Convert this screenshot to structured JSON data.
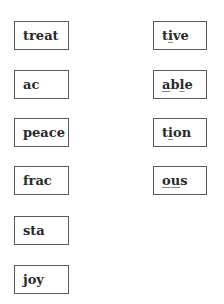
{
  "roots": [
    {
      "label": "treat"
    },
    {
      "label": "ac"
    },
    {
      "label": "peace"
    },
    {
      "label": "frac"
    },
    {
      "label": "sta"
    },
    {
      "label": "joy"
    }
  ],
  "suffixes": [
    {
      "label": "tive",
      "parts": [
        "t",
        "i",
        "ve"
      ]
    },
    {
      "label": "able",
      "parts": [
        "",
        "a",
        "b",
        "l",
        "e"
      ]
    },
    {
      "label": "tion",
      "parts": [
        "t",
        "i",
        "on"
      ]
    },
    {
      "label": "ous",
      "parts": [
        "",
        "o",
        "",
        "u",
        "s"
      ]
    }
  ]
}
